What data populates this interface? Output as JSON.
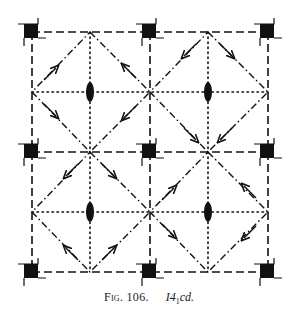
{
  "figure": {
    "number_label": "Fig. 106.",
    "space_group_prefix": "I4",
    "space_group_subscript": "1",
    "space_group_suffix": "cd.",
    "space_group_full": "I4₁cd"
  },
  "diagram": {
    "type": "space-group symmetry diagram",
    "colors": {
      "ink": "#111111",
      "background": "#ffffff"
    },
    "grid": {
      "x": [
        32,
        90,
        150,
        208,
        268
      ],
      "y": [
        32,
        92,
        152,
        212,
        272
      ]
    },
    "corner_symbols": {
      "name": "fourfold-screw-axis",
      "count": 9,
      "positions_x": [
        32,
        150,
        268
      ],
      "positions_y": [
        32,
        152,
        272
      ]
    },
    "twofold_axes": {
      "name": "twofold-rotation-axis",
      "count": 4,
      "positions": [
        [
          90,
          92
        ],
        [
          208,
          92
        ],
        [
          90,
          212
        ],
        [
          208,
          212
        ]
      ]
    },
    "line_styles": {
      "cell_edges": "dashed (c-glide planes)",
      "diagonals": "dash-dot (d-glide planes) with arrows",
      "mid_lines": "dotted (glide planes)"
    }
  }
}
